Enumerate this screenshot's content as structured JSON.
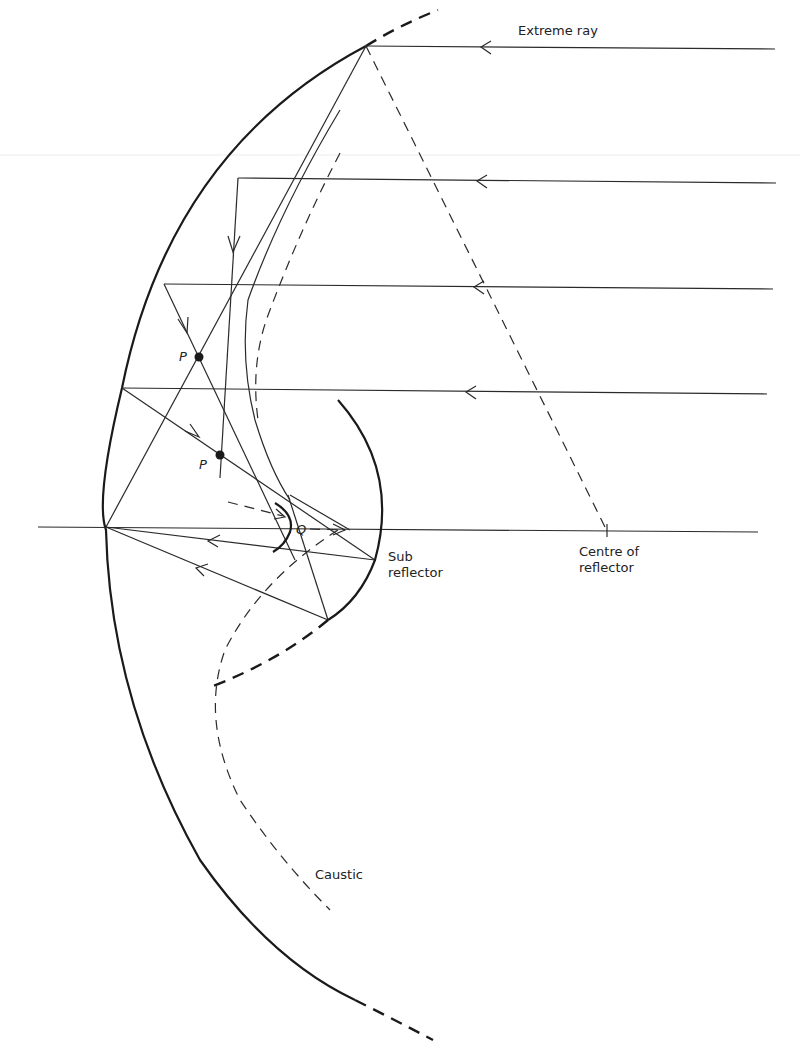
{
  "figure": {
    "labels": {
      "extreme_ray": "Extreme ray",
      "sub_reflector_line1": "Sub",
      "sub_reflector_line2": "reflector",
      "centre_line1": "Centre of",
      "centre_line2": "reflector",
      "caustic": "Caustic",
      "point_p1": "P",
      "point_p2": "P",
      "point_q": "Q"
    },
    "elements": {
      "main_reflector": "spherical mirror arc (solid, dashed extensions at both ends)",
      "sub_reflector": "curved subreflector (solid upper, dashed lower extension)",
      "caustic": "dashed caustic curve",
      "incident_rays": 4,
      "optical_axis": "horizontal line through centre of reflector"
    }
  }
}
